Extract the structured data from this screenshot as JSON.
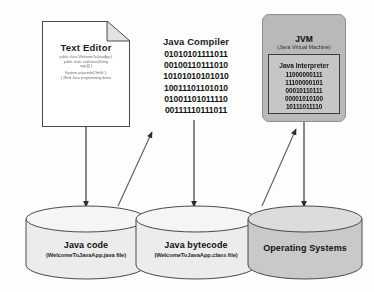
{
  "diagram": {
    "colors": {
      "jvm_fill": "#b9b9b9",
      "interpreter_fill": "#c6c6c6",
      "cylinder_light_fill": "#ececec",
      "cylinder_dark_fill": "#c9c9c9",
      "stroke": "#4a4a4a",
      "arrow": "#2b2b2b",
      "text": "#111111"
    }
  },
  "text_editor": {
    "title": "Text Editor",
    "code_block_1": [
      "public class WelcomeToJavaApp {",
      "public static void main(String",
      "args[]) {"
    ],
    "code_block_2": [
      "System.out.println(\"Hello\");",
      "} //End Java programming demo"
    ]
  },
  "compiler": {
    "title": "Java Compiler",
    "binary": [
      "01010101111011",
      "00100110111010",
      "10101010101010",
      "10011101101010",
      "01001101011110",
      "00111110111011"
    ]
  },
  "jvm": {
    "title": "JVM",
    "subtitle": "(Java Virtual Machine)",
    "interpreter": {
      "title": "Java Interpreter",
      "binary": [
        "11000000111",
        "11100000101",
        "00010110111",
        "00001010100",
        "10111011110"
      ]
    }
  },
  "stores": [
    {
      "name": "Java code",
      "file": "(WelcomeToJavaApp.java file)",
      "shade": "light"
    },
    {
      "name": "Java bytecode",
      "file": "(WelcomeToJavaApp.class file)",
      "shade": "light"
    },
    {
      "name": "Operating Systems",
      "file": "",
      "shade": "dark"
    }
  ],
  "flows": [
    {
      "from": "text-editor",
      "to": "java-code-store",
      "direction": "down"
    },
    {
      "from": "java-code-store",
      "to": "java-compiler",
      "direction": "up"
    },
    {
      "from": "java-compiler",
      "to": "java-bytecode-store",
      "direction": "down"
    },
    {
      "from": "java-bytecode-store",
      "to": "jvm",
      "direction": "up"
    },
    {
      "from": "jvm",
      "to": "operating-systems-store",
      "direction": "down"
    }
  ]
}
